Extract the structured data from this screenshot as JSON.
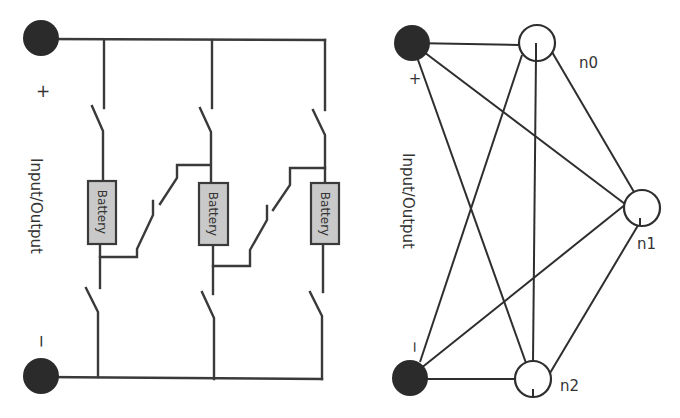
{
  "left_diagram": {
    "io_label": "Input/Output",
    "plus_sign": "+",
    "minus_sign": "−",
    "batteries": [
      {
        "label": "Battery"
      },
      {
        "label": "Battery"
      },
      {
        "label": "Battery"
      }
    ]
  },
  "right_diagram": {
    "io_label": "Input/Output",
    "plus_sign": "+",
    "minus_sign": "−",
    "nodes": [
      {
        "id": "n0",
        "label": "n0"
      },
      {
        "id": "n1",
        "label": "n1"
      },
      {
        "id": "n2",
        "label": "n2"
      }
    ],
    "edges": [
      [
        "+",
        "n0"
      ],
      [
        "+",
        "n1"
      ],
      [
        "+",
        "n2"
      ],
      [
        "-",
        "n0"
      ],
      [
        "-",
        "n1"
      ],
      [
        "-",
        "n2"
      ],
      [
        "n0",
        "n1"
      ],
      [
        "n0",
        "n2"
      ],
      [
        "n1",
        "n2"
      ]
    ]
  },
  "colors": {
    "terminal": "#2b2b2b",
    "battery_fill": "#c9c9c9",
    "line": "#3a3a3a",
    "background": "#ffffff"
  }
}
